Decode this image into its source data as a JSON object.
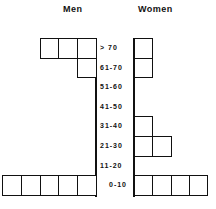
{
  "chart_data": {
    "type": "bar",
    "title": "",
    "xlabel": "",
    "ylabel": "",
    "categories": [
      "> 70",
      "61-70",
      "51-60",
      "41-50",
      "31-40",
      "21-30",
      "11-20",
      "0-10"
    ],
    "series": [
      {
        "name": "Men",
        "values": [
          3,
          1,
          0,
          0,
          0,
          0,
          0,
          5
        ]
      },
      {
        "name": "Women",
        "values": [
          1,
          1,
          0,
          0,
          1,
          2,
          0,
          4
        ]
      }
    ],
    "layout": "back-to-back unit-box histogram (age groups)"
  },
  "headers": {
    "men": "Men",
    "women": "Women"
  },
  "age_labels": [
    "> 70",
    "61-70",
    "51-60",
    "41-50",
    "31-40",
    "21-30",
    "11-20",
    "0-10"
  ]
}
